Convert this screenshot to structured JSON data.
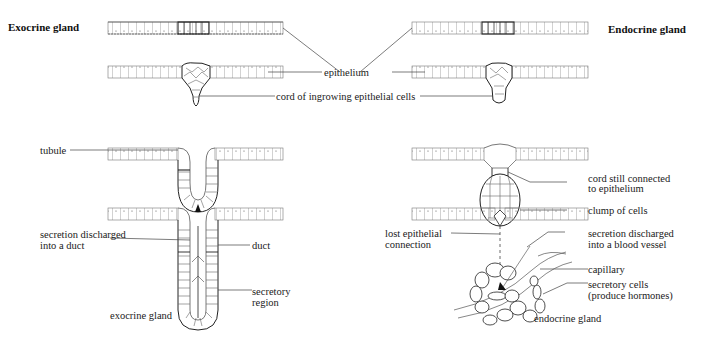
{
  "titles": {
    "left": "Exocrine gland",
    "right": "Endocrine gland"
  },
  "labels": {
    "epithelium": "epithelium",
    "cord": "cord of ingrowing epithelial cells",
    "tubule": "tubule",
    "secretion_duct_1": "secretion discharged",
    "secretion_duct_2": "into a duct",
    "duct": "duct",
    "secretory_region_1": "secretory",
    "secretory_region_2": "region",
    "exocrine_gland": "exocrine gland",
    "cord_connected_1": "cord still connected",
    "cord_connected_2": "to epithelium",
    "clump": "clump of cells",
    "lost_connection_1": "lost epithelial",
    "lost_connection_2": "connection",
    "secretion_blood_1": "secretion discharged",
    "secretion_blood_2": "into a blood vessel",
    "capillary": "capillary",
    "secretory_cells_1": "secretory cells",
    "secretory_cells_2": "(produce hormones)",
    "endocrine_gland": "endocrine gland"
  },
  "colors": {
    "line": "#333333",
    "cell_line": "#555555",
    "background": "#ffffff"
  }
}
